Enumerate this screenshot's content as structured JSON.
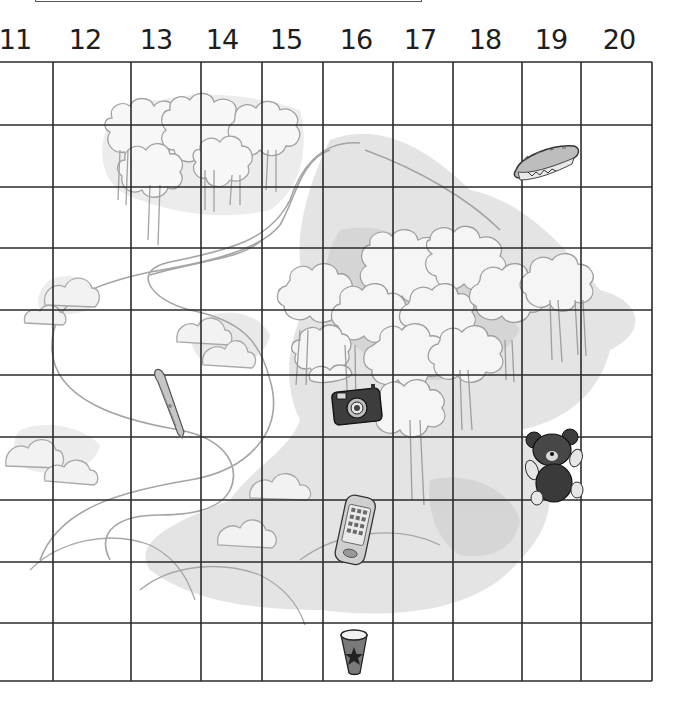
{
  "header_box": {
    "visible": true
  },
  "columns": {
    "labels": [
      "11",
      "12",
      "13",
      "14",
      "15",
      "16",
      "17",
      "18",
      "19",
      "20"
    ],
    "label_x": [
      15,
      85,
      156,
      222,
      286,
      356,
      420,
      485,
      551,
      619
    ]
  },
  "grid": {
    "col_lines_x": [
      53,
      131,
      201,
      262,
      323,
      393,
      453,
      522,
      581,
      652
    ],
    "row_lines_y": [
      62,
      125,
      187,
      248,
      310,
      375,
      437,
      500,
      562,
      623,
      681
    ],
    "line_color": "#2a2a2a"
  },
  "landscape": {
    "elements": [
      "forest-top-left",
      "forest-center-right",
      "winding-river",
      "clouds",
      "hills",
      "gray-shading"
    ],
    "stroke_color": "#a8a8a8",
    "shade_color": "#e2e2e2"
  },
  "items": [
    {
      "name": "sandwich",
      "column": "19",
      "row": 2
    },
    {
      "name": "pen",
      "column": "13",
      "row": 6
    },
    {
      "name": "camera",
      "column": "16",
      "row": 6
    },
    {
      "name": "teddy-bear",
      "column": "19",
      "row": 7
    },
    {
      "name": "mobile-phone",
      "column": "16",
      "row": 8
    },
    {
      "name": "cup",
      "column": "16",
      "row": 10
    }
  ]
}
